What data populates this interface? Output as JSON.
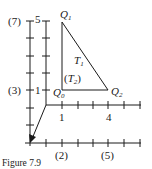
{
  "figure": {
    "caption": "Figure 7.9",
    "axes": {
      "left_axis_labels": {
        "top": "(7)",
        "mid": "(3)"
      },
      "inner_axis_labels": {
        "top": "5",
        "mid": "1"
      },
      "horizontal_axis_labels": {
        "a": "1",
        "b": "4"
      },
      "bottom_axis_labels": {
        "a": "(2)",
        "b": "(5)"
      }
    },
    "points": {
      "q1": {
        "letter": "Q",
        "sub": "1"
      },
      "q0": {
        "letter": "Q",
        "sub": "0"
      },
      "q2": {
        "letter": "Q",
        "sub": "2"
      }
    },
    "regions": {
      "t1": {
        "letter": "T",
        "sub": "1"
      },
      "t2": {
        "open": "(",
        "letter": "T",
        "sub": "2",
        "close": ")"
      }
    }
  }
}
